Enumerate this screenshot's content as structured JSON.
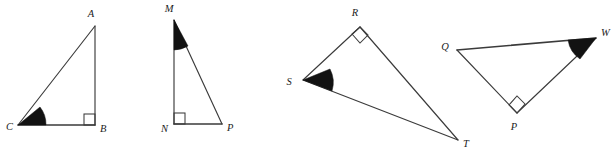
{
  "figure": {
    "canvas": {
      "width": 614,
      "height": 153,
      "background": "#ffffff"
    },
    "stroke_color": "#3b3b3b",
    "label_color": "#1c1c1c",
    "wedge_color": "#121212",
    "triangles": [
      {
        "id": "triangle-abc",
        "name": "triangle ABC",
        "vertices": [
          {
            "label": "A",
            "x": 95,
            "y": 26,
            "label_x": 91,
            "label_y": 17,
            "marker": "none"
          },
          {
            "label": "B",
            "x": 95,
            "y": 125,
            "label_x": 100,
            "label_y": 132,
            "marker": "right-angle"
          },
          {
            "label": "C",
            "x": 18,
            "y": 125,
            "label_x": 6,
            "label_y": 130,
            "marker": "shaded-angle"
          }
        ],
        "right_angle_at": "B",
        "shaded_angle_at": "C"
      },
      {
        "id": "triangle-mnp",
        "name": "triangle MNP",
        "vertices": [
          {
            "label": "M",
            "x": 174,
            "y": 20,
            "label_x": 169,
            "label_y": 12,
            "marker": "shaded-angle"
          },
          {
            "label": "N",
            "x": 174,
            "y": 124,
            "label_x": 161,
            "label_y": 132,
            "marker": "right-angle"
          },
          {
            "label": "P",
            "x": 222,
            "y": 124,
            "label_x": 227,
            "label_y": 131,
            "marker": "none"
          }
        ],
        "right_angle_at": "N",
        "shaded_angle_at": "M"
      },
      {
        "id": "triangle-rst",
        "name": "triangle RST",
        "vertices": [
          {
            "label": "R",
            "x": 360,
            "y": 27,
            "label_x": 355,
            "label_y": 16,
            "marker": "right-angle"
          },
          {
            "label": "S",
            "x": 303,
            "y": 80,
            "label_x": 289,
            "label_y": 85,
            "marker": "shaded-angle"
          },
          {
            "label": "T",
            "x": 458,
            "y": 140,
            "label_x": 463,
            "label_y": 147,
            "marker": "none"
          }
        ],
        "right_angle_at": "R",
        "shaded_angle_at": "S"
      },
      {
        "id": "triangle-qpw",
        "name": "triangle QPW",
        "vertices": [
          {
            "label": "Q",
            "x": 457,
            "y": 50,
            "label_x": 445,
            "label_y": 50,
            "marker": "none"
          },
          {
            "label": "P",
            "x": 517,
            "y": 113,
            "label_x": 514,
            "label_y": 130,
            "marker": "right-angle"
          },
          {
            "label": "W",
            "x": 596,
            "y": 38,
            "label_x": 601,
            "label_y": 36,
            "marker": "shaded-angle"
          }
        ],
        "right_angle_at": "P",
        "shaded_angle_at": "W"
      }
    ]
  }
}
